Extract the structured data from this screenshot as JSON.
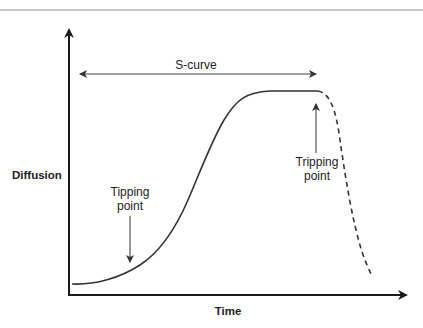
{
  "figure": {
    "type": "s-curve diffusion diagram",
    "header": {
      "heading_visible": false,
      "rule_color": "#c8c8c8"
    },
    "axes": {
      "y_label": "Diffusion",
      "x_label": "Time",
      "color": "#1a1a1a"
    },
    "annotations": {
      "span_label": "S-curve",
      "tipping_point": {
        "line1": "Tipping",
        "line2": "point"
      },
      "tripping_point": {
        "line1": "Tripping",
        "line2": "point"
      }
    },
    "curve": {
      "solid_color": "#333333",
      "dashed_color": "#333333",
      "segments": [
        {
          "name": "slow start",
          "style": "solid"
        },
        {
          "name": "steep growth",
          "style": "solid"
        },
        {
          "name": "plateau",
          "style": "solid"
        },
        {
          "name": "decline",
          "style": "dashed"
        }
      ]
    }
  }
}
